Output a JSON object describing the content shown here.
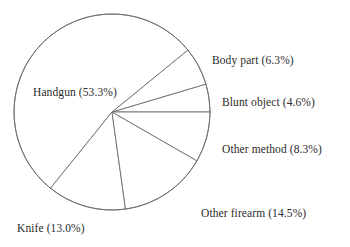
{
  "chart_data": {
    "type": "pie",
    "title": "",
    "subtitle": "",
    "xlabel": "",
    "ylabel": "",
    "legend_position": "none",
    "grid": false,
    "label_format": "{name} ({value}%)",
    "units": "percent",
    "start_angle_deg": 0,
    "direction": "counterclockwise",
    "center": {
      "x": 112,
      "y": 112
    },
    "radius": 98,
    "categories": [
      "Blunt object",
      "Body part",
      "Handgun",
      "Knife",
      "Other firearm",
      "Other method"
    ],
    "values": [
      4.6,
      6.3,
      53.3,
      13.0,
      14.5,
      8.3
    ],
    "slices": [
      {
        "name": "Blunt object",
        "value": 4.6,
        "label": "Blunt object (4.6%)",
        "start_angle_deg": 0,
        "end_angle_deg": 16.56,
        "color": "#ffffff",
        "stroke": "#6e6e6e"
      },
      {
        "name": "Body part",
        "value": 6.3,
        "label": "Body part (6.3%)",
        "start_angle_deg": 16.56,
        "end_angle_deg": 39.24,
        "color": "#ffffff",
        "stroke": "#6e6e6e"
      },
      {
        "name": "Handgun",
        "value": 53.3,
        "label": "Handgun (53.3%)",
        "start_angle_deg": 39.24,
        "end_angle_deg": 231.12,
        "color": "#ffffff",
        "stroke": "#6e6e6e"
      },
      {
        "name": "Knife",
        "value": 13.0,
        "label": "Knife (13.0%)",
        "start_angle_deg": 231.12,
        "end_angle_deg": 277.92,
        "color": "#ffffff",
        "stroke": "#6e6e6e"
      },
      {
        "name": "Other firearm",
        "value": 14.5,
        "label": "Other firearm (14.5%)",
        "start_angle_deg": 277.92,
        "end_angle_deg": 330.12,
        "color": "#ffffff",
        "stroke": "#6e6e6e"
      },
      {
        "name": "Other method",
        "value": 8.3,
        "label": "Other method (8.3%)",
        "start_angle_deg": 330.12,
        "end_angle_deg": 360,
        "color": "#ffffff",
        "stroke": "#6e6e6e"
      }
    ]
  },
  "labels": {
    "handgun": "Handgun (53.3%)",
    "body_part": "Body part (6.3%)",
    "blunt_object": "Blunt object (4.6%)",
    "other_method": "Other method (8.3%)",
    "other_firearm": "Other firearm (14.5%)",
    "knife": "Knife (13.0%)"
  },
  "style": {
    "background": "#ffffff",
    "slice_fill": "#ffffff",
    "line_color": "#6e6e6e",
    "text_color": "#2b2b2b"
  }
}
